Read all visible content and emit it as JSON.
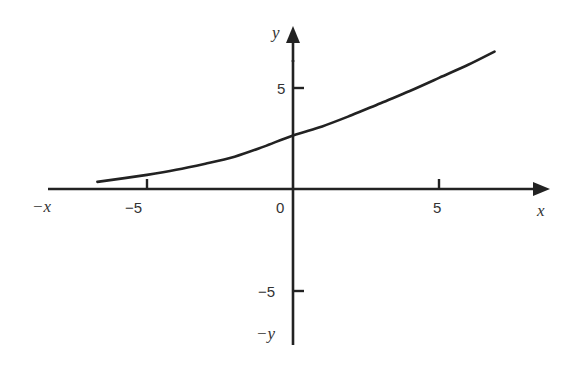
{
  "chart_data": {
    "type": "line",
    "title": "",
    "xlabel": "x",
    "ylabel": "y",
    "x_neg_label": "-x",
    "y_neg_label": "-y",
    "x_ticks": [
      -5,
      0,
      5
    ],
    "y_ticks": [
      5,
      -5
    ],
    "x_tick_labels": [
      "−5",
      "0",
      "5"
    ],
    "y_tick_labels": [
      "5",
      "−5"
    ],
    "xlim": [
      -10,
      8.6
    ],
    "ylim": [
      -7.8,
      9.3
    ],
    "grid": false,
    "legend": null,
    "series": [
      {
        "name": "curve",
        "x": [
          -6.7,
          -5,
          -4,
          -3,
          -2,
          -1,
          0,
          1,
          2,
          3,
          4,
          5,
          6,
          6.9
        ],
        "y": [
          0.35,
          0.7,
          0.95,
          1.25,
          1.6,
          2.1,
          2.65,
          3.1,
          3.65,
          4.25,
          4.85,
          5.5,
          6.15,
          6.8
        ]
      }
    ]
  },
  "axes": {
    "origin_label": "0",
    "x_axis_label": "x",
    "y_axis_label": "y",
    "x_neg_label": "−x",
    "y_neg_label": "−y",
    "x_tick_neg5": "−5",
    "x_tick_pos5": "5",
    "y_tick_pos5": "5",
    "y_tick_neg5": "−5"
  },
  "colors": {
    "axis": "#222222",
    "curve": "#222222",
    "text": "#333333"
  }
}
